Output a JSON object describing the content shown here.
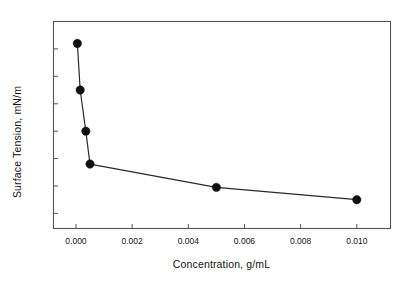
{
  "chart_data": {
    "type": "line",
    "title": "",
    "xlabel": "Concentration, g/mL",
    "ylabel": "Surface Tension, mN/m",
    "xlim": [
      -0.0008,
      0.0112
    ],
    "ylim": [
      20.45,
      28.0
    ],
    "xticks": [
      0.0,
      0.002,
      0.004,
      0.006,
      0.008,
      0.01
    ],
    "xticklabels": [
      "0.000",
      "0.002",
      "0.004",
      "0.006",
      "0.008",
      "0.010"
    ],
    "yticks": [
      21,
      22,
      23,
      24,
      25,
      26,
      27,
      28
    ],
    "yticklabels": [
      "21",
      "22",
      "23",
      "24",
      "25",
      "26",
      "27",
      "28"
    ],
    "grid": false,
    "legend": null,
    "marker": "filled-circle",
    "marker_color": "#101010",
    "line_color": "#2a2a2a",
    "frame_color": "#555555",
    "series": [
      {
        "name": "Surface tension",
        "x": [
          5e-05,
          0.00015,
          0.00035,
          0.0005,
          0.005,
          0.01
        ],
        "y": [
          27.2,
          25.5,
          24.0,
          22.8,
          21.95,
          21.5
        ],
        "points": [
          {
            "x": 5e-05,
            "y": 27.2
          },
          {
            "x": 0.00015,
            "y": 25.5
          },
          {
            "x": 0.00035,
            "y": 24.0
          },
          {
            "x": 0.0005,
            "y": 22.8
          },
          {
            "x": 0.005,
            "y": 21.95
          },
          {
            "x": 0.01,
            "y": 21.5
          }
        ]
      }
    ]
  },
  "axes": {
    "y_title": "Surface Tension, mN/m",
    "x_title": "Concentration, g/mL"
  }
}
